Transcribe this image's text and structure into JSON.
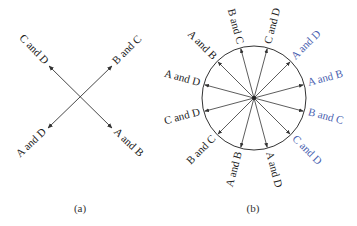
{
  "colors": {
    "line": "#333333",
    "text_black": "#222222",
    "text_blue": "#4a5fb0"
  },
  "panel_a": {
    "caption": "(a)",
    "center": [
      80,
      98
    ],
    "arrows": [
      {
        "label": "C and D",
        "end": [
          49,
          66
        ],
        "color": "black"
      },
      {
        "label": "B and C",
        "end": [
          112,
          66
        ],
        "color": "black"
      },
      {
        "label": "A and D",
        "end": [
          48,
          128
        ],
        "color": "black"
      },
      {
        "label": "A and B",
        "end": [
          112,
          128
        ],
        "color": "black"
      }
    ]
  },
  "panel_b": {
    "caption": "(b)",
    "center": [
      254,
      98
    ],
    "radius": 52,
    "arrows": [
      {
        "label": "B and C",
        "angle": -105,
        "color": "black"
      },
      {
        "label": "C and D",
        "angle": -75,
        "color": "black"
      },
      {
        "label": "A and D",
        "angle": -45,
        "color": "blue"
      },
      {
        "label": "A and B",
        "angle": -15,
        "color": "blue"
      },
      {
        "label": "B and C",
        "angle": 15,
        "color": "blue"
      },
      {
        "label": "C and D",
        "angle": 45,
        "color": "blue"
      },
      {
        "label": "A and D",
        "angle": 75,
        "color": "black"
      },
      {
        "label": "A and B",
        "angle": 105,
        "color": "black"
      },
      {
        "label": "B and C",
        "angle": 135,
        "color": "black"
      },
      {
        "label": "C and D",
        "angle": 165,
        "color": "black"
      },
      {
        "label": "A and D",
        "angle": 195,
        "color": "black"
      },
      {
        "label": "A and B",
        "angle": 225,
        "color": "black"
      }
    ]
  }
}
